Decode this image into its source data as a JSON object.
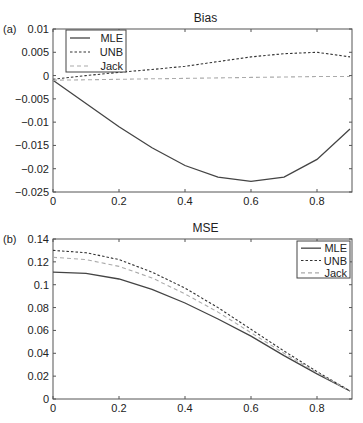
{
  "chart_data": [
    {
      "panel_label": "(a)",
      "type": "line",
      "title": "Bias",
      "xlabel": "",
      "ylabel": "",
      "x": [
        0,
        0.1,
        0.2,
        0.3,
        0.4,
        0.5,
        0.6,
        0.7,
        0.8,
        0.9
      ],
      "xlim": [
        0,
        0.9
      ],
      "ylim": [
        -0.025,
        0.01
      ],
      "xticks": [
        "0",
        "0.2",
        "0.4",
        "0.6",
        "0.8"
      ],
      "yticks": [
        "0.01",
        "0.005",
        "0",
        "-0.005",
        "-0.01",
        "-0.015",
        "-0.02",
        "-0.025"
      ],
      "grid": false,
      "legend_position": "upper left",
      "series": [
        {
          "name": "MLE",
          "style": "solid",
          "color": "#444444",
          "values": [
            -0.001,
            -0.006,
            -0.011,
            -0.0155,
            -0.0193,
            -0.0218,
            -0.0227,
            -0.0218,
            -0.018,
            -0.0115
          ]
        },
        {
          "name": "UNB",
          "style": "dashed",
          "color": "#333333",
          "values": [
            -0.0008,
            0.0,
            0.0007,
            0.0013,
            0.002,
            0.003,
            0.004,
            0.0047,
            0.005,
            0.004
          ]
        },
        {
          "name": "Jack",
          "style": "dashed-light",
          "color": "#aaaaaa",
          "values": [
            -0.001,
            -0.0009,
            -0.0008,
            -0.0007,
            -0.0006,
            -0.0005,
            -0.0004,
            -0.0003,
            -0.0002,
            -0.0002
          ]
        }
      ]
    },
    {
      "panel_label": "(b)",
      "type": "line",
      "title": "MSE",
      "xlabel": "",
      "ylabel": "",
      "x": [
        0,
        0.1,
        0.2,
        0.3,
        0.4,
        0.5,
        0.6,
        0.7,
        0.8,
        0.9
      ],
      "xlim": [
        0,
        0.9
      ],
      "ylim": [
        0,
        0.14
      ],
      "xticks": [
        "0",
        "0.2",
        "0.4",
        "0.6",
        "0.8"
      ],
      "yticks": [
        "0.14",
        "0.12",
        "0.1",
        "0.08",
        "0.06",
        "0.04",
        "0.02",
        "0"
      ],
      "grid": false,
      "legend_position": "upper right",
      "series": [
        {
          "name": "MLE",
          "style": "solid",
          "color": "#444444",
          "values": [
            0.111,
            0.11,
            0.105,
            0.096,
            0.084,
            0.07,
            0.055,
            0.038,
            0.022,
            0.007
          ]
        },
        {
          "name": "UNB",
          "style": "dashed",
          "color": "#333333",
          "values": [
            0.13,
            0.128,
            0.122,
            0.111,
            0.097,
            0.08,
            0.061,
            0.042,
            0.024,
            0.007
          ]
        },
        {
          "name": "Jack",
          "style": "dashed-light",
          "color": "#aaaaaa",
          "values": [
            0.124,
            0.122,
            0.116,
            0.106,
            0.092,
            0.076,
            0.058,
            0.04,
            0.023,
            0.007
          ]
        }
      ]
    }
  ]
}
